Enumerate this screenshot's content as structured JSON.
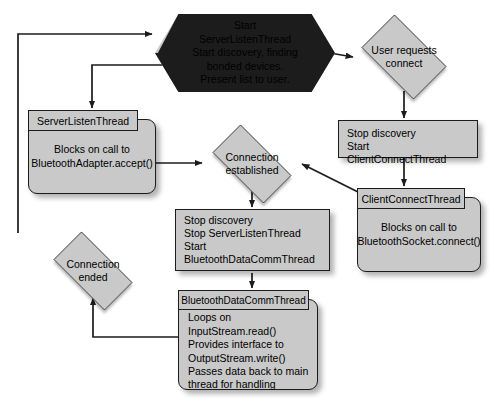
{
  "diagram": {
    "type": "flowchart",
    "fill_color": "#c9c9c9",
    "stroke_color": "#1c1c1c",
    "background_color": "#ffffff"
  },
  "nodes": {
    "start": {
      "shape": "hexagon",
      "lines": [
        "Start",
        "ServerListenThread",
        "Start discovery, finding",
        "bonded devices.",
        "Present list to user."
      ]
    },
    "user_requests_connect": {
      "shape": "diamond",
      "lines": [
        "User requests",
        "connect"
      ]
    },
    "stop_discovery_start_client": {
      "shape": "process",
      "lines": [
        "Stop discovery",
        "Start ClientConnectThread"
      ]
    },
    "client_connect_thread": {
      "shape": "thread-frame",
      "tab_label": "ClientConnectThread",
      "lines": [
        "Blocks on call to",
        "BluetoothSocket.connect()"
      ]
    },
    "server_listen_thread": {
      "shape": "thread-frame",
      "tab_label": "ServerListenThread",
      "lines": [
        "Blocks on call to",
        "BluetoothAdapter.accept()"
      ]
    },
    "connection_established": {
      "shape": "diamond",
      "lines": [
        "Connection",
        "established"
      ]
    },
    "stop_discovery_start_datacomm": {
      "shape": "process",
      "lines": [
        "Stop discovery",
        "Stop ServerListenThread",
        "Start BluetoothDataCommThread"
      ]
    },
    "bluetooth_data_comm_thread": {
      "shape": "thread-frame",
      "tab_label": "BluetoothDataCommThread",
      "lines": [
        "Loops on InputStream.read()",
        "Provides interface to",
        "OutputStream.write()",
        "Passes data back to main",
        "thread for handling"
      ]
    },
    "connection_ended": {
      "shape": "diamond",
      "lines": [
        "Connection",
        "ended"
      ]
    }
  },
  "edges": [
    {
      "name": "edge-loop-to-start",
      "from": "connection_ended",
      "to": "start"
    },
    {
      "name": "edge-start-to-server-listen-thread",
      "from": "start",
      "to": "server_listen_thread"
    },
    {
      "name": "edge-start-to-user-requests-connect",
      "from": "start",
      "to": "user_requests_connect"
    },
    {
      "name": "edge-user-requests-to-stop-discovery",
      "from": "user_requests_connect",
      "to": "stop_discovery_start_client"
    },
    {
      "name": "edge-stop-discovery-to-client-connect-thread",
      "from": "stop_discovery_start_client",
      "to": "client_connect_thread"
    },
    {
      "name": "edge-client-connect-to-connection-established",
      "from": "client_connect_thread",
      "to": "connection_established"
    },
    {
      "name": "edge-server-listen-to-connection-established",
      "from": "server_listen_thread",
      "to": "connection_established"
    },
    {
      "name": "edge-connection-established-to-stop-discovery",
      "from": "connection_established",
      "to": "stop_discovery_start_datacomm"
    },
    {
      "name": "edge-stop-discovery-to-data-comm-thread",
      "from": "stop_discovery_start_datacomm",
      "to": "bluetooth_data_comm_thread"
    },
    {
      "name": "edge-data-comm-to-connection-ended",
      "from": "bluetooth_data_comm_thread",
      "to": "connection_ended"
    }
  ]
}
